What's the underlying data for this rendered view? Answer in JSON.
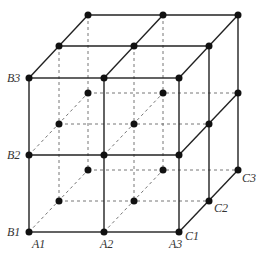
{
  "diagram": {
    "type": "3D lattice cube (2x2x2 grid)",
    "labels": {
      "A1": "A1",
      "A2": "A2",
      "A3": "A3",
      "B1": "B1",
      "B2": "B2",
      "B3": "B3",
      "C1": "C1",
      "C2": "C2",
      "C3": "C3"
    },
    "colors": {
      "line": "#222222",
      "dashed": "#666666",
      "dot": "#111111",
      "label": "#333333"
    }
  }
}
